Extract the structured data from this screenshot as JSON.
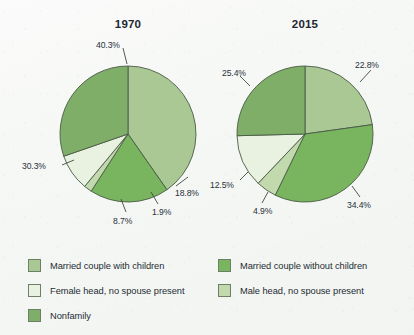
{
  "background_color": "#f7f8f6",
  "categories": [
    "Married couple with children",
    "Married couple without children",
    "Female head, no spouse present",
    "Male head, no spouse present",
    "Nonfamily"
  ],
  "colors": {
    "married_with_children": "#a9c894",
    "married_without_children": "#79b45f",
    "female_head": "#e9f1e1",
    "male_head": "#c2d9ad",
    "nonfamily": "#7fae69",
    "outline": "#4a5a46",
    "text": "#29313a"
  },
  "charts": [
    {
      "title": "1970",
      "labels": [
        "40.3%",
        "18.8%",
        "1.9%",
        "8.7%",
        "30.3%"
      ]
    },
    {
      "title": "2015",
      "labels": [
        "22.8%",
        "34.4%",
        "4.9%",
        "12.5%",
        "25.4%"
      ]
    }
  ],
  "legend": {
    "left": [
      {
        "label": "Married couple with children",
        "color": "#a9c894"
      },
      {
        "label": "Female head, no spouse present",
        "color": "#e9f1e1"
      },
      {
        "label": "Nonfamily",
        "color": "#7fae69"
      }
    ],
    "right": [
      {
        "label": "Married couple without children",
        "color": "#79b45f"
      },
      {
        "label": "Male head, no spouse present",
        "color": "#c2d9ad"
      }
    ]
  },
  "chart_data": {
    "type": "pie",
    "title": "",
    "legend_position": "bottom",
    "series": [
      {
        "name": "1970",
        "categories": [
          "Married couple with children",
          "Married couple without children",
          "Male head, no spouse present",
          "Female head, no spouse present",
          "Nonfamily"
        ],
        "values": [
          40.3,
          18.8,
          1.9,
          8.7,
          30.3
        ],
        "labels": [
          "40.3%",
          "18.8%",
          "1.9%",
          "8.7%",
          "30.3%"
        ],
        "colors": [
          "#a9c894",
          "#79b45f",
          "#c2d9ad",
          "#e9f1e1",
          "#7fae69"
        ]
      },
      {
        "name": "2015",
        "categories": [
          "Married couple with children",
          "Married couple without children",
          "Male head, no spouse present",
          "Female head, no spouse present",
          "Nonfamily"
        ],
        "values": [
          22.8,
          34.4,
          4.9,
          12.5,
          25.4
        ],
        "labels": [
          "22.8%",
          "34.4%",
          "4.9%",
          "12.5%",
          "25.4%"
        ],
        "colors": [
          "#a9c894",
          "#79b45f",
          "#c2d9ad",
          "#e9f1e1",
          "#7fae69"
        ]
      }
    ]
  }
}
